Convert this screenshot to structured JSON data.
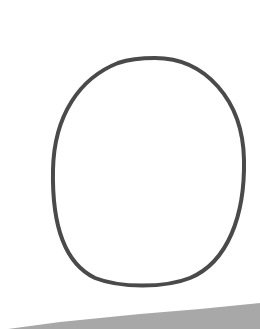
{
  "image": {
    "description": "Hand-drawn oval outline on white paper with a gray surface at the bottom",
    "background_color": "#ffffff",
    "shape": {
      "type": "oval-outline",
      "stroke_color": "#4a4a4a",
      "stroke_width": 4,
      "center": [
        149,
        171
      ],
      "bbox": [
        52,
        57,
        246,
        286
      ]
    },
    "bottom_surface": {
      "color": "#a8a8a8",
      "left_top_y": 328,
      "right_top_y": 304
    }
  }
}
